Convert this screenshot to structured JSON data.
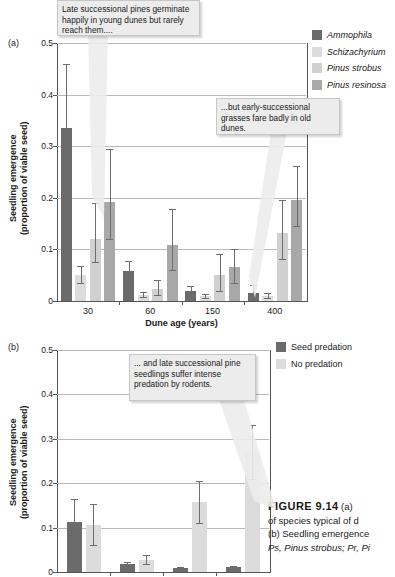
{
  "figure": {
    "caption_lines": [
      "FIGURE 9.14   (a)",
      "of species typical of d",
      "(b) Seedling emergence"
    ],
    "caption_italic_line": "Ps, Pinus strobus; Pr, Pi",
    "caption_head": "FIGURE 9.14",
    "caption_head_rest": "(a)"
  },
  "panel_a": {
    "letter": "(a)",
    "callouts": [
      {
        "id": "callout-young-dunes",
        "text": "Late successional pines germinate happily in young dunes but rarely reach them...."
      },
      {
        "id": "callout-old-dunes",
        "text": "...but early-successional grasses fare badly in old dunes."
      }
    ],
    "legend": {
      "items": [
        {
          "label": "Ammophila",
          "color": "#6b6b6b",
          "italic": true
        },
        {
          "label": "Schizachyrium",
          "color": "#dcdcdc",
          "italic": true
        },
        {
          "label": "Pinus strobus",
          "color": "#d0d0d0",
          "italic": true
        },
        {
          "label": "Pinus resinosa",
          "color": "#a8a8a8",
          "italic": true
        }
      ]
    },
    "chart_data": {
      "type": "bar",
      "title": "",
      "xlabel": "Dune age (years)",
      "ylabel": "Seedling emergence (proportion of viable seed)",
      "ylabel_line1": "Seedling emergence",
      "ylabel_line2": "(proportion of viable seed)",
      "categories": [
        "30",
        "60",
        "150",
        "400"
      ],
      "ylim": [
        0,
        0.5
      ],
      "yticks": [
        0,
        0.1,
        0.2,
        0.3,
        0.4,
        0.5
      ],
      "ytick_labels": [
        "0",
        "0.1",
        "0.2",
        "0.3",
        "0.4",
        "0.5"
      ],
      "grid": true,
      "legend_position": "right",
      "series": [
        {
          "name": "Ammophila",
          "color": "#6b6b6b",
          "values": [
            0.335,
            0.059,
            0.02,
            0.015
          ],
          "err_upper": [
            0.46,
            0.077,
            0.029,
            0.031
          ],
          "err_lower": [
            0.335,
            0.045,
            0.013,
            0.008
          ]
        },
        {
          "name": "Schizachyrium",
          "color": "#dcdcdc",
          "values": [
            0.05,
            0.012,
            0.01,
            0.01
          ],
          "err_upper": [
            0.068,
            0.018,
            0.014,
            0.016
          ],
          "err_lower": [
            0.034,
            0.007,
            0.006,
            0.005
          ]
        },
        {
          "name": "Pinus strobus",
          "color": "#d0d0d0",
          "values": [
            0.121,
            0.024,
            0.05,
            0.132
          ],
          "err_upper": [
            0.19,
            0.041,
            0.091,
            0.196
          ],
          "err_lower": [
            0.075,
            0.011,
            0.02,
            0.082
          ]
        },
        {
          "name": "Pinus resinosa",
          "color": "#a8a8a8",
          "values": [
            0.191,
            0.108,
            0.065,
            0.196
          ],
          "err_upper": [
            0.294,
            0.178,
            0.1,
            0.262
          ],
          "err_lower": [
            0.12,
            0.06,
            0.035,
            0.145
          ]
        }
      ]
    }
  },
  "panel_b": {
    "letter": "(b)",
    "callouts": [
      {
        "id": "callout-predation",
        "text": "... and late successional pine seedlings suffer intense predation by rodents."
      }
    ],
    "legend": {
      "items": [
        {
          "label": "Seed predation",
          "color": "#6b6b6b",
          "italic": false
        },
        {
          "label": "No predation",
          "color": "#dcdcdc",
          "italic": false
        }
      ]
    },
    "chart_data": {
      "type": "bar",
      "title": "",
      "xlabel": "",
      "ylabel": "Seedling emergence (proportion of viable seed)",
      "ylabel_line1": "Seedling emergence",
      "ylabel_line2": "(proportion of viable seed)",
      "categories": [
        "",
        "",
        "",
        ""
      ],
      "ylim": [
        0,
        0.5
      ],
      "yticks": [
        0,
        0.1,
        0.2,
        0.3,
        0.4,
        0.5
      ],
      "ytick_labels": [
        "0",
        "0.1",
        "0.2",
        "0.3",
        "0.4",
        "0.5"
      ],
      "grid": true,
      "legend_position": "right",
      "series": [
        {
          "name": "Seed predation",
          "color": "#6b6b6b",
          "values": [
            0.112,
            0.017,
            0.008,
            0.011
          ],
          "err_upper": [
            0.164,
            0.023,
            0.011,
            0.014
          ],
          "err_lower": [
            0.057,
            0.011,
            0.005,
            0.008
          ]
        },
        {
          "name": "No predation",
          "color": "#dcdcdc",
          "values": [
            0.107,
            0.027,
            0.157,
            0.27
          ],
          "err_upper": [
            0.153,
            0.038,
            0.205,
            0.332
          ],
          "err_lower": [
            0.06,
            0.017,
            0.11,
            0.209
          ]
        }
      ]
    }
  }
}
